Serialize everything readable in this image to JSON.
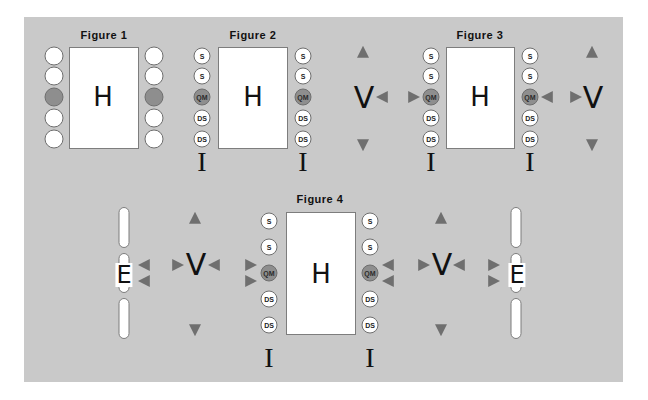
{
  "figures": [
    {
      "title": "Figure 1",
      "center_label": "H",
      "left_column": [
        "",
        "",
        "",
        "",
        ""
      ],
      "right_column": [
        "",
        "",
        "",
        "",
        ""
      ],
      "highlighted_index": 2
    },
    {
      "title": "Figure 2",
      "center_label": "H",
      "left_column": [
        "S",
        "S",
        "QM",
        "DS",
        "DS"
      ],
      "right_column": [
        "S",
        "S",
        "QM",
        "DS",
        "DS"
      ],
      "highlighted_index": 2,
      "base_marks": [
        "I",
        "I"
      ]
    },
    {
      "title": "Figure 3",
      "center_label": "H",
      "left_column": [
        "S",
        "S",
        "QM",
        "DS",
        "DS"
      ],
      "right_column": [
        "S",
        "S",
        "QM",
        "DS",
        "DS"
      ],
      "highlighted_index": 2,
      "side_labels": [
        "V",
        "V"
      ],
      "base_marks": [
        "I",
        "I"
      ]
    },
    {
      "title": "Figure 4",
      "center_label": "H",
      "left_column": [
        "S",
        "S",
        "QM",
        "DS",
        "DS"
      ],
      "right_column": [
        "S",
        "S",
        "QM",
        "DS",
        "DS"
      ],
      "highlighted_index": 2,
      "side_labels": [
        "V",
        "V"
      ],
      "outer_labels": [
        "E",
        "E"
      ],
      "base_marks": [
        "I",
        "I"
      ]
    }
  ],
  "colors": {
    "panel_bg": "#c9c9c9",
    "box_bg": "#ffffff",
    "highlight_circle": "#8e8e8e",
    "arrow": "#787878"
  }
}
